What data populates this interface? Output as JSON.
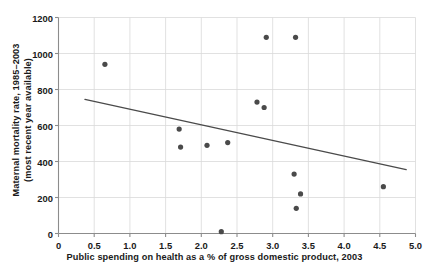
{
  "chart_data": {
    "type": "scatter",
    "title": "",
    "xlabel": "Public spending on health as a % of gross domestic product, 2003",
    "ylabel": "Maternal mortality rate, 1985–2003 (most recent year available)",
    "ylabel_line1": "Maternal mortality rate, 1985–2003",
    "ylabel_line2": "(most recent year available)",
    "xlim": [
      0,
      5.0
    ],
    "ylim": [
      0,
      1200
    ],
    "xticks": [
      "0",
      "0.5",
      "1.0",
      "1.5",
      "2.0",
      "2.5",
      "3.0",
      "3.5",
      "4.0",
      "4.5",
      "5.0"
    ],
    "xtick_values": [
      0,
      0.5,
      1.0,
      1.5,
      2.0,
      2.5,
      3.0,
      3.5,
      4.0,
      4.5,
      5.0
    ],
    "yticks": [
      "0",
      "200",
      "400",
      "600",
      "800",
      "1000",
      "1200"
    ],
    "ytick_values": [
      0,
      200,
      400,
      600,
      800,
      1000,
      1200
    ],
    "grid": true,
    "grid_color": "#d9d9d9",
    "legend": null,
    "marker_color": "#4a4a4a",
    "marker_size": 4.6,
    "axis_color": "#8c8c8c",
    "trendline_color": "#4a4a4a",
    "points": [
      {
        "x": 0.65,
        "y": 940
      },
      {
        "x": 1.69,
        "y": 580
      },
      {
        "x": 1.71,
        "y": 480
      },
      {
        "x": 2.08,
        "y": 490
      },
      {
        "x": 2.28,
        "y": 10
      },
      {
        "x": 2.37,
        "y": 505
      },
      {
        "x": 2.78,
        "y": 730
      },
      {
        "x": 2.88,
        "y": 700
      },
      {
        "x": 2.91,
        "y": 1090
      },
      {
        "x": 3.3,
        "y": 330
      },
      {
        "x": 3.32,
        "y": 1090
      },
      {
        "x": 3.33,
        "y": 140
      },
      {
        "x": 3.39,
        "y": 220
      },
      {
        "x": 4.55,
        "y": 260
      }
    ],
    "trendline": {
      "type": "linear-fit",
      "x_start": 0.37,
      "y_start": 745,
      "x_end": 4.87,
      "y_end": 355
    }
  }
}
